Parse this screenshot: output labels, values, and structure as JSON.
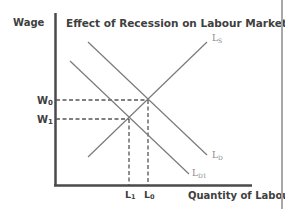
{
  "title": "Effect of Recession on Labour Markets",
  "axes": {
    "y_label": "Wage",
    "x_label": "Quantity of Labour"
  },
  "curves": {
    "supply": {
      "label": "L",
      "sub": "S"
    },
    "demand": {
      "label": "L",
      "sub": "D"
    },
    "demand_new": {
      "label": "L",
      "sub": "D1"
    }
  },
  "equilibria": {
    "w0": {
      "label": "W",
      "sub": "0"
    },
    "w1": {
      "label": "W",
      "sub": "1"
    },
    "l0": {
      "label": "L",
      "sub": "0"
    },
    "l1": {
      "label": "L",
      "sub": "1"
    }
  },
  "colors": {
    "axis": "#4a4a4a",
    "curve": "#7a7a7a",
    "dashed": "#555555",
    "text": "#404040"
  }
}
